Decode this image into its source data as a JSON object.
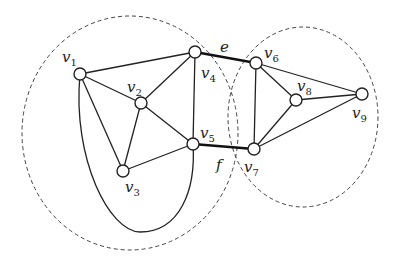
{
  "diagram": {
    "type": "graph",
    "regions": [
      {
        "id": "left-component",
        "cx": 130,
        "cy": 133,
        "rx": 108,
        "ry": 117
      },
      {
        "id": "right-component",
        "cx": 303,
        "cy": 117,
        "rx": 75,
        "ry": 90
      }
    ],
    "nodes": [
      {
        "id": "v1",
        "label": "v",
        "sub": "1",
        "x": 80,
        "y": 74,
        "lx": 62,
        "ly": 62
      },
      {
        "id": "v2",
        "label": "v",
        "sub": "2",
        "x": 141,
        "y": 103,
        "lx": 127,
        "ly": 92
      },
      {
        "id": "v3",
        "label": "v",
        "sub": "3",
        "x": 123,
        "y": 171,
        "lx": 125,
        "ly": 192
      },
      {
        "id": "v4",
        "label": "v",
        "sub": "4",
        "x": 195,
        "y": 52,
        "lx": 201,
        "ly": 78
      },
      {
        "id": "v5",
        "label": "v",
        "sub": "5",
        "x": 193,
        "y": 144,
        "lx": 200,
        "ly": 138
      },
      {
        "id": "v6",
        "label": "v",
        "sub": "6",
        "x": 256,
        "y": 63,
        "lx": 264,
        "ly": 58
      },
      {
        "id": "v7",
        "label": "v",
        "sub": "7",
        "x": 254,
        "y": 149,
        "lx": 244,
        "ly": 172
      },
      {
        "id": "v8",
        "label": "v",
        "sub": "8",
        "x": 296,
        "y": 100,
        "lx": 297,
        "ly": 91
      },
      {
        "id": "v9",
        "label": "v",
        "sub": "9",
        "x": 362,
        "y": 94,
        "lx": 352,
        "ly": 118
      }
    ],
    "edges": [
      [
        "v1",
        "v4"
      ],
      [
        "v1",
        "v2"
      ],
      [
        "v1",
        "v3"
      ],
      [
        "v2",
        "v4"
      ],
      [
        "v2",
        "v5"
      ],
      [
        "v2",
        "v3"
      ],
      [
        "v3",
        "v5"
      ],
      [
        "v4",
        "v5"
      ],
      [
        "v6",
        "v7"
      ],
      [
        "v6",
        "v8"
      ],
      [
        "v6",
        "v9"
      ],
      [
        "v8",
        "v9"
      ],
      [
        "v8",
        "v7"
      ],
      [
        "v7",
        "v9"
      ]
    ],
    "curved_edges": [
      {
        "from": "v1",
        "to": "v5",
        "path": "M80,74 C72,160 110,232 140,232 C180,232 196,190 193,144"
      }
    ],
    "bridges": [
      {
        "from": "v4",
        "to": "v6",
        "label": "e",
        "lx": 220,
        "ly": 52
      },
      {
        "from": "v5",
        "to": "v7",
        "label": "f",
        "lx": 216,
        "ly": 170
      }
    ]
  }
}
